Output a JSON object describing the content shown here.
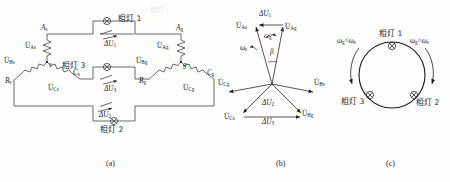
{
  "figure": {
    "title_cut_top": "相灯 1",
    "captions": [
      {
        "key": "a",
        "text": "(a)"
      },
      {
        "key": "b",
        "text": "(b)"
      },
      {
        "key": "c",
        "text": "(c)"
      }
    ]
  },
  "panel_a": {
    "lamps": [
      {
        "id": "lamp1",
        "label": "相灯 1"
      },
      {
        "id": "lamp2",
        "label": "相灯 2"
      },
      {
        "id": "lamp3",
        "label": "相灯 3"
      }
    ],
    "delta_voltages": [
      {
        "id": "dU1",
        "main": "ΔU",
        "sub": "1"
      },
      {
        "id": "dU2",
        "main": "ΔU",
        "sub": "2"
      },
      {
        "id": "dU3",
        "main": "ΔU",
        "sub": "3"
      }
    ],
    "left_source": {
      "terminals": [
        {
          "id": "As",
          "main": "A",
          "sub": "s"
        },
        {
          "id": "Bs",
          "main": "B",
          "sub": "s"
        },
        {
          "id": "Cs",
          "main": "C",
          "sub": "s"
        }
      ],
      "neutral": "s",
      "phase_voltages": [
        {
          "id": "UAs",
          "main": "U",
          "sub": "As"
        },
        {
          "id": "UBs",
          "main": "U",
          "sub": "Bs"
        },
        {
          "id": "UCs",
          "main": "U",
          "sub": "Cs"
        }
      ]
    },
    "right_source": {
      "terminals": [
        {
          "id": "Ag",
          "main": "A",
          "sub": "g"
        },
        {
          "id": "Bg",
          "main": "B",
          "sub": "g"
        },
        {
          "id": "Cg",
          "main": "C",
          "sub": "g"
        }
      ],
      "neutral": "g",
      "phase_voltages": [
        {
          "id": "UAg",
          "main": "U",
          "sub": "Ag"
        },
        {
          "id": "UBg",
          "main": "U",
          "sub": "Bg"
        },
        {
          "id": "UCg",
          "main": "U",
          "sub": "Cg"
        }
      ]
    }
  },
  "panel_b": {
    "phasors": [
      {
        "id": "UAs",
        "main": "U",
        "sub": "As",
        "dot": true
      },
      {
        "id": "UAg",
        "main": "U",
        "sub": "Ag",
        "dot": true
      },
      {
        "id": "UBs",
        "main": "U",
        "sub": "Bs",
        "dot": true
      },
      {
        "id": "UBg",
        "main": "U",
        "sub": "Bg",
        "dot": true
      },
      {
        "id": "UCs",
        "main": "U",
        "sub": "Cs",
        "dot": true
      },
      {
        "id": "UCg",
        "main": "U",
        "sub": "Cg",
        "dot": true
      }
    ],
    "difference_phasors": [
      {
        "id": "dU1",
        "main": "ΔU",
        "sub": "1",
        "dot": true
      },
      {
        "id": "dU2",
        "main": "ΔU",
        "sub": "2",
        "dot": true
      },
      {
        "id": "dU3",
        "main": "ΔU",
        "sub": "3",
        "dot": true
      }
    ],
    "angular_speeds": [
      {
        "id": "omega_g",
        "main": "ω",
        "sub": "g"
      },
      {
        "id": "omega_s",
        "main": "ω",
        "sub": "s"
      }
    ],
    "angle": "β"
  },
  "panel_c": {
    "lamps": [
      {
        "id": "lamp1",
        "label": "相灯 1",
        "position": "top"
      },
      {
        "id": "lamp2",
        "label": "相灯 2",
        "position": "bottom-right"
      },
      {
        "id": "lamp3",
        "label": "相灯 3",
        "position": "bottom-left"
      }
    ],
    "conditions": [
      {
        "id": "ccw",
        "text": "ωg<ωs",
        "main": "ω",
        "sub": "g",
        "rel": "<",
        "main2": "ω",
        "sub2": "s"
      },
      {
        "id": "cw",
        "text": "ωg>ωs",
        "main": "ω",
        "sub": "g",
        "rel": ">",
        "main2": "ω",
        "sub2": "s"
      }
    ]
  },
  "colors": {
    "ink": "#1c1c1c",
    "line": "#2a2a2a",
    "paper": "#fdfdfc"
  }
}
